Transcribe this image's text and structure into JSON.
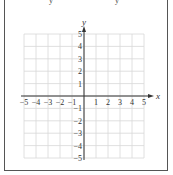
{
  "figure": {
    "top_text_fragments": [
      "y",
      "y"
    ]
  },
  "chart_data": {
    "type": "coordinate-grid",
    "title": "",
    "xlabel": "x",
    "ylabel": "y",
    "xlim": [
      -5,
      5
    ],
    "ylim": [
      -5,
      5
    ],
    "grid": true,
    "x_ticks": [
      "−5",
      "−4",
      "−3",
      "−2",
      "−1",
      "1",
      "2",
      "3",
      "4",
      "5"
    ],
    "y_ticks": [
      "5",
      "4",
      "3",
      "2",
      "1",
      "−1",
      "−2",
      "−3",
      "−4",
      "−5"
    ],
    "series": []
  },
  "colors": {
    "grid": "#d8d8d8",
    "axis": "#333333",
    "frame": "#555555"
  }
}
